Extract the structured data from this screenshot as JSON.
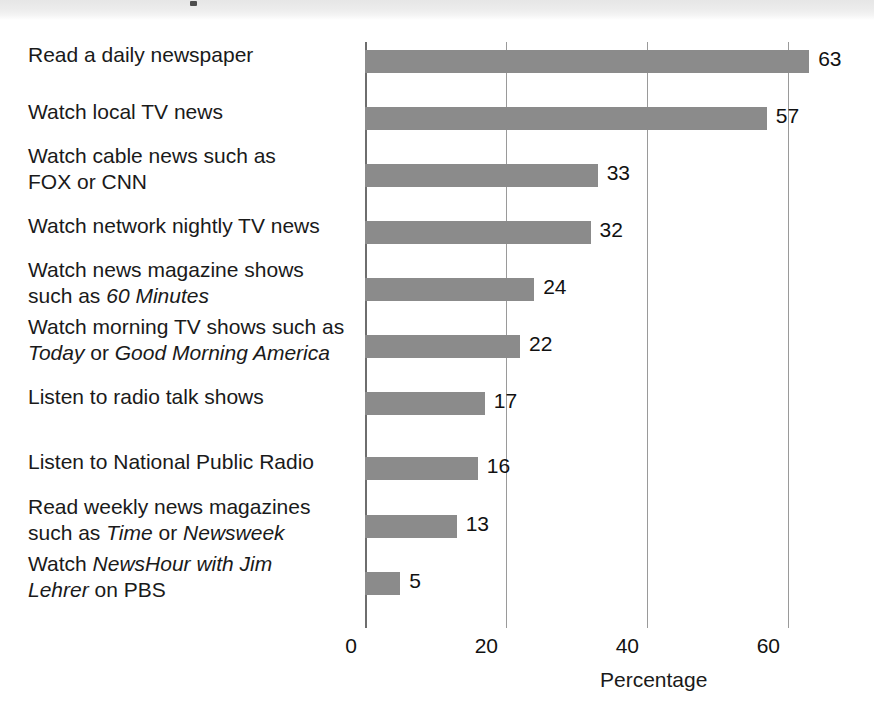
{
  "chart_data": {
    "type": "bar",
    "orientation": "horizontal",
    "title": "",
    "xlabel": "Percentage",
    "ylabel": "",
    "xlim": [
      0,
      66
    ],
    "xticks": [
      0,
      20,
      40,
      60
    ],
    "xtick_labels": [
      "0",
      "20",
      "40",
      "60"
    ],
    "grid": "vertical-only",
    "legend": "none",
    "bar_color": "#8b8b8b",
    "categories": [
      "Read a daily newspaper",
      "Watch local TV news",
      "Watch cable news such as\nFOX or CNN",
      "Watch network nightly TV news",
      "Watch news magazine shows\nsuch as 60 Minutes",
      "Watch morning TV shows such as\nToday or Good Morning America",
      "Listen to radio talk shows",
      "Listen to National Public Radio",
      "Read weekly news magazines\nsuch as Time or Newsweek",
      "Watch NewsHour with Jim\nLehrer on PBS"
    ],
    "values": [
      63,
      57,
      33,
      32,
      24,
      22,
      17,
      16,
      13,
      5
    ],
    "value_labels": [
      "63",
      "57",
      "33",
      "32",
      "24",
      "22",
      "17",
      "16",
      "13",
      "5"
    ]
  },
  "rows": [
    {
      "label_html": "Read a daily newspaper",
      "label_text": "Read a daily newspaper",
      "value": 63,
      "value_label": "63",
      "bar_top": 8,
      "label_top": 0
    },
    {
      "label_html": "Watch local TV news",
      "label_text": "Watch local TV news",
      "value": 57,
      "value_label": "57",
      "bar_top": 65,
      "label_top": 57
    },
    {
      "label_html": "Watch cable news such as<br>FOX or CNN",
      "label_text": "Watch cable news such as FOX or CNN",
      "value": 33,
      "value_label": "33",
      "bar_top": 122,
      "label_top": 101
    },
    {
      "label_html": "Watch network nightly TV news",
      "label_text": "Watch network nightly TV news",
      "value": 32,
      "value_label": "32",
      "bar_top": 179,
      "label_top": 171
    },
    {
      "label_html": "Watch news magazine shows<br>such as <i>60 Minutes</i>",
      "label_text": "Watch news magazine shows such as 60 Minutes",
      "value": 24,
      "value_label": "24",
      "bar_top": 236,
      "label_top": 215
    },
    {
      "label_html": "Watch morning TV shows such as<br><i>Today</i> or <i>Good Morning America</i>",
      "label_text": "Watch morning TV shows such as Today or Good Morning America",
      "value": 22,
      "value_label": "22",
      "bar_top": 293,
      "label_top": 272
    },
    {
      "label_html": "Listen to radio talk shows",
      "label_text": "Listen to radio talk shows",
      "value": 17,
      "value_label": "17",
      "bar_top": 350,
      "label_top": 342
    },
    {
      "label_html": "Listen to National Public Radio",
      "label_text": "Listen to National Public Radio",
      "value": 16,
      "value_label": "16",
      "bar_top": 415,
      "label_top": 407
    },
    {
      "label_html": "Read weekly news magazines<br>such as <i>Time</i> or <i>Newsweek</i>",
      "label_text": "Read weekly news magazines such as Time or Newsweek",
      "value": 13,
      "value_label": "13",
      "bar_top": 473,
      "label_top": 452
    },
    {
      "label_html": "Watch <i>NewsHour with Jim<br>Lehrer</i> on PBS",
      "label_text": "Watch NewsHour with Jim Lehrer on PBS",
      "value": 5,
      "value_label": "5",
      "bar_top": 530,
      "label_top": 509
    }
  ],
  "axis": {
    "title": "Percentage",
    "ticks": [
      {
        "value": 0,
        "label": "0"
      },
      {
        "value": 20,
        "label": "20"
      },
      {
        "value": 40,
        "label": "40"
      },
      {
        "value": 60,
        "label": "60"
      }
    ]
  }
}
